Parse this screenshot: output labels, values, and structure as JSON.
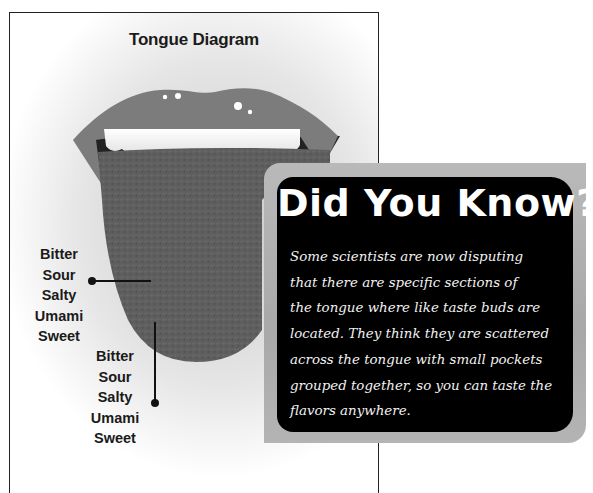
{
  "diagram": {
    "title": "Tongue Diagram",
    "taste_labels_left": [
      "Bitter",
      "Sour",
      "Salty",
      "Umami",
      "Sweet"
    ],
    "taste_labels_right": [
      "Bitter",
      "Sour",
      "Salty",
      "Umami",
      "Sweet"
    ]
  },
  "callout": {
    "heading": "Did You Know?",
    "body_lines": [
      "Some scientists are now disputing",
      "that there are specific sections of",
      "the tongue where like taste buds are",
      "located. They think they are scattered",
      "across the tongue with small pockets",
      "grouped together, so you can taste the",
      "flavors anywhere."
    ]
  },
  "colors": {
    "lips": "#7b7b7b",
    "tongue": "#5e5e5e",
    "teeth": "#f4f4f4",
    "callout_bg": "#000000",
    "callout_border": "#adadad",
    "callout_text": "#ffffff"
  }
}
